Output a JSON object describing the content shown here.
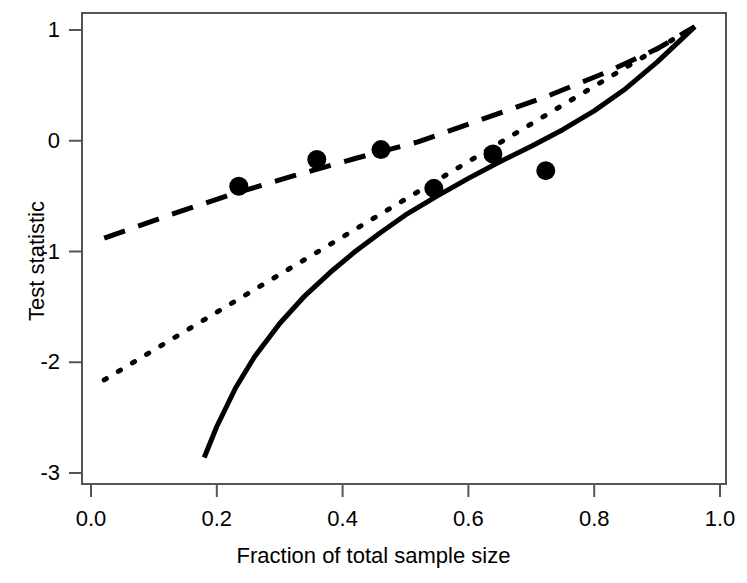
{
  "chart_data": {
    "type": "line",
    "title": "",
    "xlabel": "Fraction of total sample size",
    "ylabel": "Test statistic",
    "xlim": [
      0.0,
      1.0
    ],
    "ylim": [
      -3,
      1
    ],
    "grid": false,
    "legend": "none",
    "x_ticks": [
      "0.0",
      "0.2",
      "0.4",
      "0.6",
      "0.8",
      "1.0"
    ],
    "x_tick_values": [
      0.0,
      0.2,
      0.4,
      0.6,
      0.8,
      1.0
    ],
    "y_ticks": [
      "1",
      "0",
      "-1",
      "-2",
      "-3"
    ],
    "y_tick_values": [
      1,
      0,
      -1,
      -2,
      -3
    ],
    "series": [
      {
        "name": "dashed-boundary",
        "style": "dashed",
        "color": "#000000",
        "x": [
          0.021,
          0.12,
          0.22,
          0.32,
          0.42,
          0.52,
          0.62,
          0.72,
          0.82,
          0.9,
          0.96
        ],
        "y": [
          -0.88,
          -0.68,
          -0.49,
          -0.32,
          -0.16,
          -0.01,
          0.19,
          0.39,
          0.62,
          0.83,
          1.03
        ]
      },
      {
        "name": "dotted-boundary",
        "style": "dotted",
        "color": "#000000",
        "x": [
          0.021,
          0.12,
          0.22,
          0.32,
          0.42,
          0.52,
          0.62,
          0.72,
          0.82,
          0.9,
          0.96
        ],
        "y": [
          -2.16,
          -1.82,
          -1.48,
          -1.14,
          -0.8,
          -0.46,
          -0.12,
          0.22,
          0.56,
          0.83,
          1.03
        ]
      },
      {
        "name": "solid-boundary",
        "style": "solid",
        "color": "#000000",
        "x": [
          0.18,
          0.2,
          0.23,
          0.26,
          0.3,
          0.34,
          0.38,
          0.42,
          0.46,
          0.5,
          0.55,
          0.6,
          0.65,
          0.7,
          0.75,
          0.8,
          0.85,
          0.9,
          0.96
        ],
        "y": [
          -2.86,
          -2.58,
          -2.23,
          -1.95,
          -1.65,
          -1.4,
          -1.19,
          -1.0,
          -0.83,
          -0.67,
          -0.5,
          -0.34,
          -0.19,
          -0.05,
          0.1,
          0.27,
          0.47,
          0.71,
          1.03
        ]
      }
    ],
    "points": {
      "name": "observed-test-statistics",
      "marker": "filled-circle",
      "color": "#000000",
      "x": [
        0.235,
        0.359,
        0.461,
        0.545,
        0.639,
        0.723
      ],
      "y": [
        -0.41,
        -0.17,
        -0.08,
        -0.43,
        -0.12,
        -0.27
      ]
    }
  },
  "axes": {
    "x_title": "Fraction of total sample size",
    "y_title": "Test statistic"
  },
  "colors": {
    "line": "#000000",
    "axis": "#555555",
    "background": "#ffffff"
  }
}
